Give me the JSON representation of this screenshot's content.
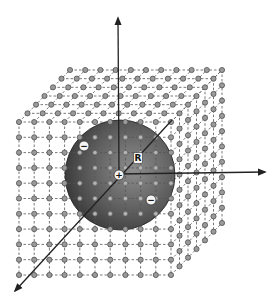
{
  "figure": {
    "labels": {
      "radius": "R",
      "center_charge": "+",
      "neg_charge_1": "−",
      "neg_charge_2": "−"
    },
    "lattice": {
      "front_face_cols": 11,
      "front_face_rows": 11,
      "depth_layers": 7,
      "node_color": "#9a9a9a",
      "node_stroke": "#444444",
      "line_color": "#555555"
    },
    "sphere": {
      "center_x": 120,
      "center_y": 175,
      "radius": 55,
      "dark_color": "#2e2e2e",
      "light_color": "#8a8a8a"
    },
    "axes": {
      "color": "#222222",
      "vertical_top": [
        118,
        18
      ],
      "horizontal_end": [
        265,
        172
      ],
      "diagonal_end": [
        15,
        291
      ]
    }
  }
}
